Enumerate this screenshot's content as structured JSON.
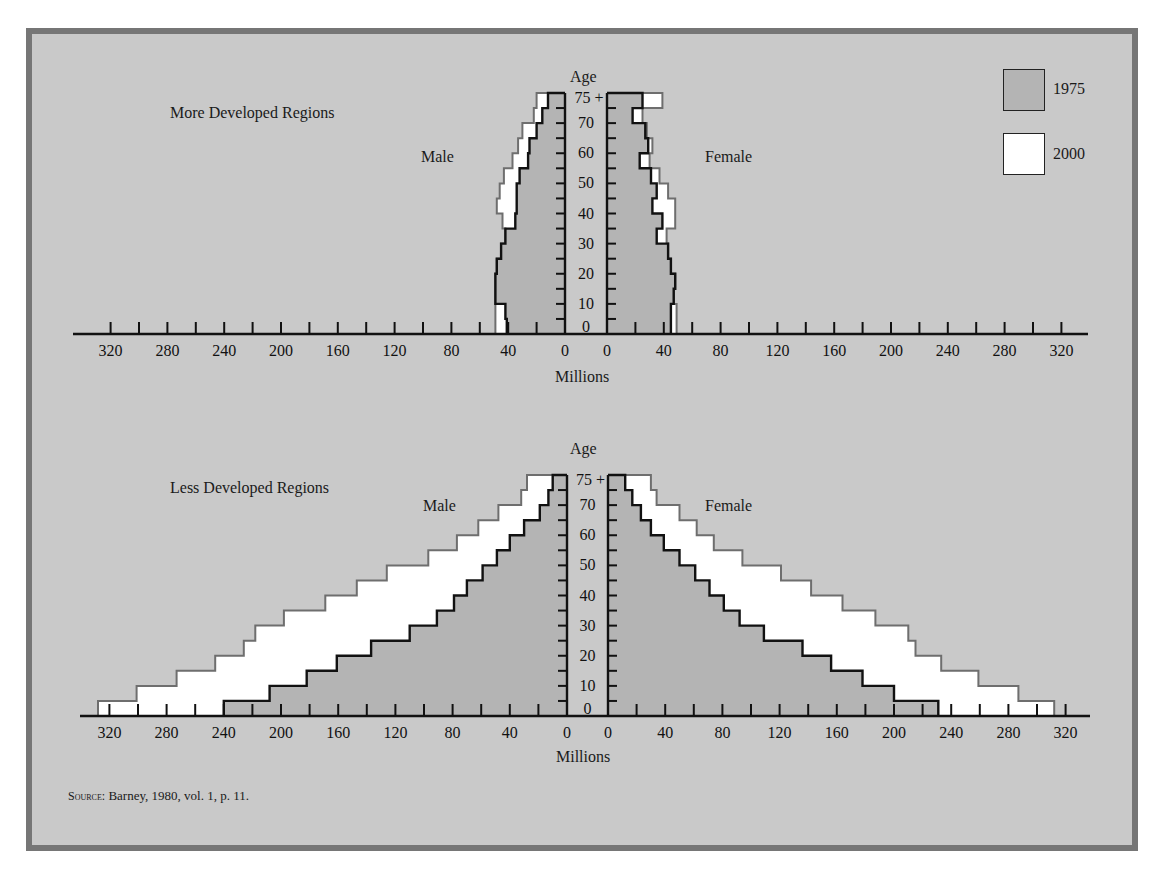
{
  "source_note": {
    "prefix": "Source:",
    "text": "Barney, 1980, vol. 1, p. 11."
  },
  "legend": [
    {
      "label": "1975",
      "color": "#b4b4b4"
    },
    {
      "label": "2000",
      "color": "#ffffff"
    }
  ],
  "colors": {
    "panel_background": "#c9c9c9",
    "frame_border": "#767676",
    "series_1975_fill": "#b4b4b4",
    "series_1975_line": "#111111",
    "series_2000_fill": "#ffffff",
    "series_2000_line": "#6e6e6e"
  },
  "panels": {
    "top": {
      "title": "More Developed Regions",
      "male_label": "Male",
      "female_label": "Female",
      "age_label": "Age",
      "xlabel": "Millions"
    },
    "bottom": {
      "title": "Less Developed Regions",
      "male_label": "Male",
      "female_label": "Female",
      "age_label": "Age",
      "xlabel": "Millions"
    }
  },
  "chart_data": [
    {
      "type": "bar",
      "subtype": "population-pyramid",
      "title": "More Developed Regions",
      "xlabel": "Millions",
      "ylabel": "Age",
      "x_ticks": [
        0,
        40,
        80,
        120,
        160,
        200,
        240,
        280,
        320
      ],
      "xlim": [
        0,
        340
      ],
      "y_tick_labels": [
        "0",
        "10",
        "20",
        "30",
        "40",
        "50",
        "60",
        "70",
        "75 +"
      ],
      "legend": [
        "1975",
        "2000"
      ],
      "legend_position": "top-right",
      "categories": [
        "0-4",
        "5-9",
        "10-14",
        "15-19",
        "20-24",
        "25-29",
        "30-34",
        "35-39",
        "40-44",
        "45-49",
        "50-54",
        "55-59",
        "60-64",
        "65-69",
        "70-74",
        "75+"
      ],
      "series": [
        {
          "name": "Male 1975",
          "values": [
            41,
            42,
            49,
            49,
            48,
            45,
            42,
            35,
            34,
            34,
            32,
            26,
            25,
            20,
            16,
            12
          ]
        },
        {
          "name": "Male 2000",
          "values": [
            49,
            49,
            49,
            49,
            48,
            45,
            42,
            44,
            48,
            46,
            43,
            37,
            33,
            30,
            22,
            20
          ]
        },
        {
          "name": "Female 1975",
          "values": [
            45,
            45,
            47,
            48,
            45,
            43,
            35,
            39,
            32,
            35,
            31,
            23,
            29,
            27,
            18,
            25
          ]
        },
        {
          "name": "Female 2000",
          "values": [
            49,
            49,
            47,
            48,
            45,
            43,
            42,
            48,
            48,
            43,
            37,
            30,
            32,
            28,
            25,
            39
          ]
        }
      ]
    },
    {
      "type": "bar",
      "subtype": "population-pyramid",
      "title": "Less Developed Regions",
      "xlabel": "Millions",
      "ylabel": "Age",
      "x_ticks": [
        0,
        40,
        80,
        120,
        160,
        200,
        240,
        280,
        320
      ],
      "xlim": [
        0,
        340
      ],
      "y_tick_labels": [
        "0",
        "10",
        "20",
        "30",
        "40",
        "50",
        "60",
        "70",
        "75 +"
      ],
      "legend": [
        "1975",
        "2000"
      ],
      "categories": [
        "0-4",
        "5-9",
        "10-14",
        "15-19",
        "20-24",
        "25-29",
        "30-34",
        "35-39",
        "40-44",
        "45-49",
        "50-54",
        "55-59",
        "60-64",
        "65-69",
        "70-74",
        "75+"
      ],
      "series": [
        {
          "name": "Male 1975",
          "values": [
            240,
            208,
            182,
            161,
            137,
            110,
            91,
            79,
            70,
            59,
            49,
            40,
            30,
            19,
            13,
            10
          ]
        },
        {
          "name": "Male 2000",
          "values": [
            328,
            301,
            273,
            246,
            226,
            218,
            198,
            169,
            147,
            126,
            97,
            77,
            62,
            48,
            32,
            28
          ]
        },
        {
          "name": "Female 1975",
          "values": [
            231,
            200,
            178,
            156,
            136,
            109,
            92,
            81,
            71,
            61,
            50,
            39,
            30,
            23,
            17,
            12
          ]
        },
        {
          "name": "Female 2000",
          "values": [
            312,
            287,
            259,
            233,
            215,
            210,
            187,
            164,
            142,
            121,
            94,
            74,
            62,
            50,
            34,
            30
          ]
        }
      ]
    }
  ]
}
